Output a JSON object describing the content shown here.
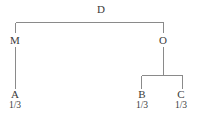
{
  "diagram": {
    "type": "inheritance-tree",
    "title": "",
    "line_color": "#8a8a8a",
    "text_color": "#3a3a3a",
    "background_color": "#ffffff",
    "nodes": {
      "root": {
        "label": "D",
        "share": ""
      },
      "branch_left": {
        "label": "M",
        "share": ""
      },
      "branch_right": {
        "label": "O",
        "share": ""
      },
      "leaf_a": {
        "label": "A",
        "share": "1/3"
      },
      "leaf_b": {
        "label": "B",
        "share": "1/3"
      },
      "leaf_c": {
        "label": "C",
        "share": "1/3"
      }
    }
  }
}
